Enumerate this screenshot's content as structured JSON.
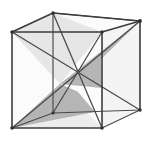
{
  "figure": {
    "kind": "geometry-diagram",
    "title": "Cube with intersecting interior diagonal planes",
    "background_color": "#ffffff",
    "edge_color": "#3c3c3c",
    "diagonal_color": "#4a4a4a",
    "shade_color": "#b5b5b5",
    "shade_color_light": "#c9c9c9",
    "face_color": "#fbfbfb",
    "face_color_alt": "#f4f4f4",
    "vertices": {
      "front_top_left": [
        12,
        32
      ],
      "front_top_right": [
        102,
        32
      ],
      "front_bottom_left": [
        12,
        128
      ],
      "front_bottom_right": [
        102,
        128
      ],
      "back_top_left": [
        53,
        13
      ],
      "back_top_right": [
        140,
        21
      ],
      "back_bottom_left": [
        53,
        113
      ],
      "back_bottom_right": [
        140,
        110
      ]
    },
    "labels": []
  },
  "chart_data": {
    "type": "diagram",
    "title": "Cube with intersecting interior diagonal planes",
    "shape": "cube",
    "projection": "oblique",
    "vertex_count": 8,
    "edge_count": 12,
    "shaded_plane_count": 2,
    "vertices": [
      {
        "name": "front-top-left",
        "x": 12,
        "y": 32
      },
      {
        "name": "front-top-right",
        "x": 102,
        "y": 32
      },
      {
        "name": "front-bottom-left",
        "x": 12,
        "y": 128
      },
      {
        "name": "front-bottom-right",
        "x": 102,
        "y": 128
      },
      {
        "name": "back-top-left",
        "x": 53,
        "y": 13
      },
      {
        "name": "back-top-right",
        "x": 140,
        "y": 21
      },
      {
        "name": "back-bottom-left",
        "x": 53,
        "y": 113
      },
      {
        "name": "back-bottom-right",
        "x": 140,
        "y": 110
      }
    ],
    "edges": [
      [
        "front-top-left",
        "front-top-right"
      ],
      [
        "front-top-right",
        "front-bottom-right"
      ],
      [
        "front-bottom-right",
        "front-bottom-left"
      ],
      [
        "front-bottom-left",
        "front-top-left"
      ],
      [
        "back-top-left",
        "back-top-right"
      ],
      [
        "back-top-right",
        "back-bottom-right"
      ],
      [
        "back-bottom-right",
        "back-bottom-left"
      ],
      [
        "back-bottom-left",
        "back-top-left"
      ],
      [
        "front-top-left",
        "back-top-left"
      ],
      [
        "front-top-right",
        "back-top-right"
      ],
      [
        "front-bottom-left",
        "back-bottom-left"
      ],
      [
        "front-bottom-right",
        "back-bottom-right"
      ]
    ],
    "interior_lines": [
      [
        "front-top-left",
        "back-bottom-right"
      ],
      [
        "back-top-left",
        "front-bottom-right"
      ],
      [
        "front-bottom-left",
        "back-top-right"
      ],
      [
        "back-bottom-left",
        "front-top-right"
      ]
    ],
    "shaded_regions": [
      {
        "name": "upper-right-shaded-plane",
        "fill": "#b5b5b5"
      },
      {
        "name": "lower-left-shaded-plane",
        "fill": "#b5b5b5"
      }
    ]
  }
}
